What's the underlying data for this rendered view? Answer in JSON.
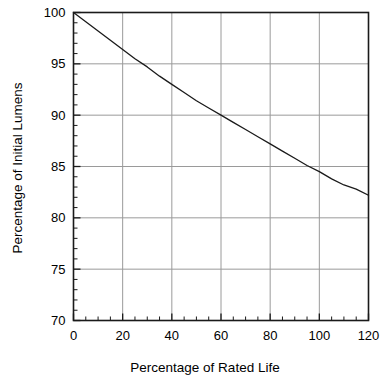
{
  "chart_data": {
    "type": "line",
    "title": "",
    "xlabel": "Percentage of Rated Life",
    "ylabel": "Percentage of Initial Lumens",
    "xlim": [
      0,
      120
    ],
    "ylim": [
      70,
      100
    ],
    "grid": true,
    "legend": false,
    "legend_position": "none",
    "x_ticks": [
      0,
      20,
      40,
      60,
      80,
      100,
      120
    ],
    "x_tick_labels": [
      "0",
      "20",
      "40",
      "60",
      "80",
      "100",
      "120"
    ],
    "x_minor_tick_step": 5,
    "y_ticks": [
      70,
      75,
      80,
      85,
      90,
      95,
      100
    ],
    "y_tick_labels": [
      "70",
      "75",
      "80",
      "85",
      "90",
      "95",
      "100"
    ],
    "y_minor_tick_step": 1,
    "line_color": "#1a1a1a",
    "grid_color": "#9a9a9a",
    "axis_color": "#1a1a1a",
    "background_color": "#ffffff",
    "series": [
      {
        "name": "Lumen Depreciation",
        "x": [
          0,
          5,
          10,
          15,
          20,
          25,
          30,
          35,
          40,
          45,
          50,
          55,
          60,
          65,
          70,
          75,
          80,
          85,
          90,
          95,
          100,
          105,
          110,
          115,
          120
        ],
        "values": [
          100.0,
          99.1,
          98.2,
          97.3,
          96.4,
          95.5,
          94.7,
          93.8,
          93.0,
          92.2,
          91.4,
          90.7,
          90.0,
          89.3,
          88.6,
          87.9,
          87.2,
          86.5,
          85.8,
          85.1,
          84.5,
          83.8,
          83.2,
          82.8,
          82.2
        ]
      }
    ],
    "annotations": []
  },
  "axis_titles": {
    "x": "Percentage of Rated Life",
    "y": "Percentage of Initial Lumens"
  }
}
